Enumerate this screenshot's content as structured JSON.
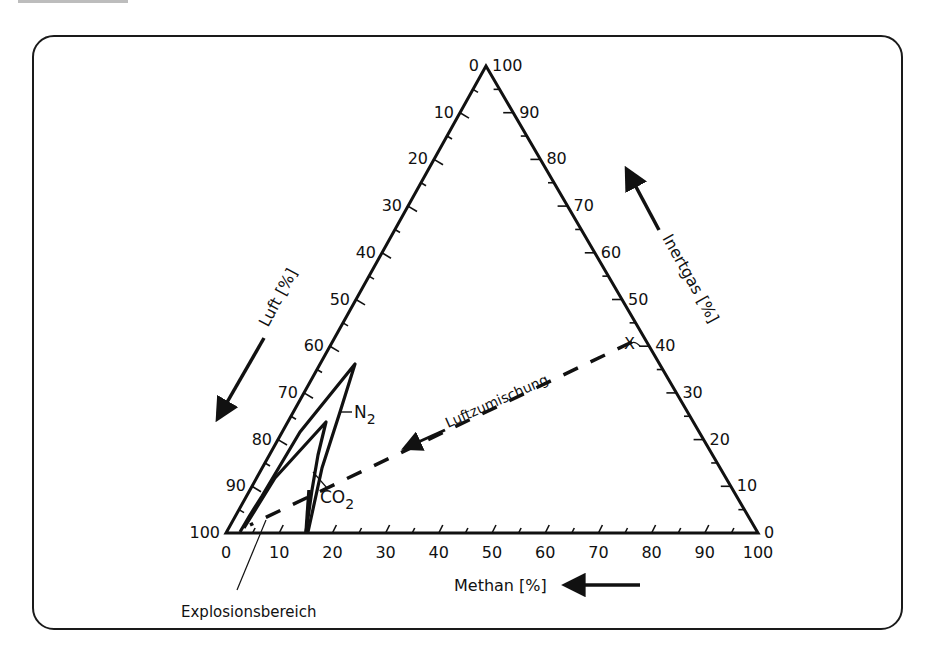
{
  "chart_data": {
    "type": "ternary",
    "title": "",
    "axes": {
      "bottom": {
        "label": "Methan [%]",
        "ticks": [
          "0",
          "10",
          "20",
          "30",
          "40",
          "50",
          "60",
          "70",
          "80",
          "90",
          "100"
        ],
        "direction": "arrow-left"
      },
      "left": {
        "label": "Luft [%]",
        "ticks": [
          "0",
          "10",
          "20",
          "30",
          "40",
          "50",
          "60",
          "70",
          "80",
          "90",
          "100"
        ],
        "direction": "arrow-down-left"
      },
      "right": {
        "label": "Inertgas [%]",
        "ticks": [
          "100",
          "90",
          "80",
          "70",
          "60",
          "50",
          "40",
          "30",
          "20",
          "10",
          "0"
        ],
        "direction": "arrow-up-left"
      }
    },
    "vertices": {
      "top": {
        "left_label": "0",
        "right_label": "100"
      },
      "bottom_left": "100",
      "bottom_right": "0"
    },
    "curves": [
      {
        "name": "N2",
        "label": "N₂",
        "description": "Explosion range boundary with nitrogen as inert gas",
        "tip_methane_pct": 14,
        "tip_inert_pct": 36
      },
      {
        "name": "CO2",
        "label": "CO₂",
        "description": "Explosion range boundary with carbon dioxide as inert gas",
        "tip_methane_pct": 12,
        "tip_inert_pct": 24
      }
    ],
    "lines": [
      {
        "name": "Luftzumischung",
        "style": "dashed",
        "from": {
          "label": "X",
          "methane_pct": 60,
          "inert_pct": 40,
          "air_pct": 0
        },
        "to": {
          "methane_pct": 2,
          "inert_pct": 4,
          "air_pct": 94
        }
      }
    ],
    "annotations": [
      "Explosionsbereich",
      "Luftzumischung",
      "X",
      "N₂",
      "CO₂"
    ]
  },
  "labels": {
    "luft": "Luft [%]",
    "inertgas": "Inertgas [%]",
    "methan": "Methan [%]",
    "luftzumischung": "Luftzumischung",
    "explosionsbereich": "Explosionsbereich",
    "x_marker": "X",
    "n2": "N",
    "n2_sub": "2",
    "co2": "CO",
    "co2_sub": "2"
  },
  "ticks": {
    "bottom": [
      "0",
      "10",
      "20",
      "30",
      "40",
      "50",
      "60",
      "70",
      "80",
      "90",
      "100"
    ],
    "left": [
      "0",
      "10",
      "20",
      "30",
      "40",
      "50",
      "60",
      "70",
      "80",
      "90",
      "100"
    ],
    "right": [
      "100",
      "90",
      "80",
      "70",
      "60",
      "50",
      "40",
      "30",
      "20",
      "10",
      "0"
    ]
  }
}
